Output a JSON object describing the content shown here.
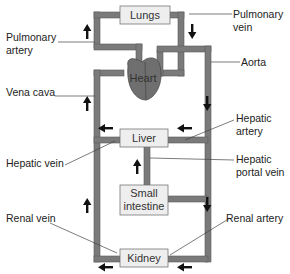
{
  "organs": {
    "lungs": "Lungs",
    "heart": "Heart",
    "liver": "Liver",
    "small_intestine_line1": "Small",
    "small_intestine_line2": "intestine",
    "kidney": "Kidney"
  },
  "labels": {
    "pulmonary_artery_1": "Pulmonary",
    "pulmonary_artery_2": "artery",
    "pulmonary_vein_1": "Pulmonary",
    "pulmonary_vein_2": "vein",
    "aorta": "Aorta",
    "vena_cava": "Vena cava",
    "hepatic_artery_1": "Hepatic",
    "hepatic_artery_2": "artery",
    "hepatic_vein": "Hepatic vein",
    "hepatic_portal_vein_1": "Hepatic",
    "hepatic_portal_vein_2": "portal vein",
    "renal_vein": "Renal vein",
    "renal_artery": "Renal artery"
  },
  "colors": {
    "vessel": "#7a7a7a",
    "vessel_edge": "#555555",
    "organ_box": "#eeeeee",
    "heart": "#6f6f6f"
  }
}
